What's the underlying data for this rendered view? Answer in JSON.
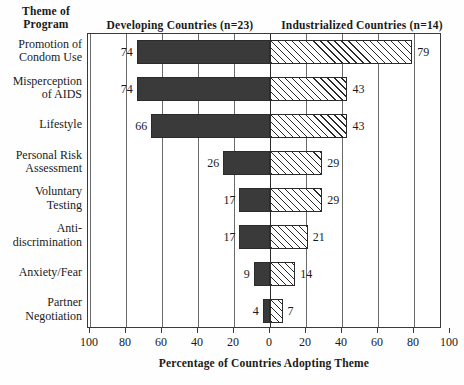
{
  "headers": {
    "theme": "Theme of\nProgram",
    "left_panel": "Developing Countries (n=23)",
    "right_panel": "Industrialized Countries (n=14)"
  },
  "axis": {
    "title": "Percentage of Countries Adopting Theme",
    "tick_labels": [
      "100",
      "80",
      "60",
      "40",
      "20",
      "0",
      "20",
      "40",
      "60",
      "80",
      "100"
    ],
    "left_max": 100,
    "right_max": 100
  },
  "chart_data": {
    "type": "bar",
    "orientation": "horizontal",
    "layout": "back-to-back diverging (population pyramid style)",
    "title": "",
    "xlabel": "Percentage of Countries Adopting Theme",
    "ylabel": "Theme of Program",
    "xlim": [
      -100,
      100
    ],
    "grid": true,
    "legend_position": "top (panel headers)",
    "categories": [
      "Promotion of Condom Use",
      "Misperception of AIDS",
      "Lifestyle",
      "Personal Risk Assessment",
      "Voluntary Testing",
      "Anti-discrimination",
      "Anxiety/Fear",
      "Partner Negotiation"
    ],
    "series": [
      {
        "name": "Developing Countries (n=23)",
        "side": "left",
        "style": "solid dark fill",
        "values": [
          74,
          74,
          66,
          26,
          17,
          17,
          9,
          4
        ]
      },
      {
        "name": "Industrialized Countries (n=14)",
        "side": "right",
        "style": "diagonal hatch fill",
        "values": [
          79,
          43,
          43,
          29,
          29,
          21,
          14,
          7
        ]
      }
    ]
  },
  "categories_display": [
    [
      "Promotion of",
      "Condom Use"
    ],
    [
      "Misperception",
      "of AIDS"
    ],
    [
      "Lifestyle"
    ],
    [
      "Personal Risk",
      "Assessment"
    ],
    [
      "Voluntary",
      "Testing"
    ],
    [
      "Anti-",
      "discrimination"
    ],
    [
      "Anxiety/Fear"
    ],
    [
      "Partner",
      "Negotiation"
    ]
  ],
  "colors": {
    "left_bar": "#3a3a3a",
    "right_bar": "#ffffff",
    "hatch": "#2b2b2b",
    "frame": "#3a3a3a",
    "grid": "#6a6a6a",
    "text": "#1a1a1a"
  }
}
